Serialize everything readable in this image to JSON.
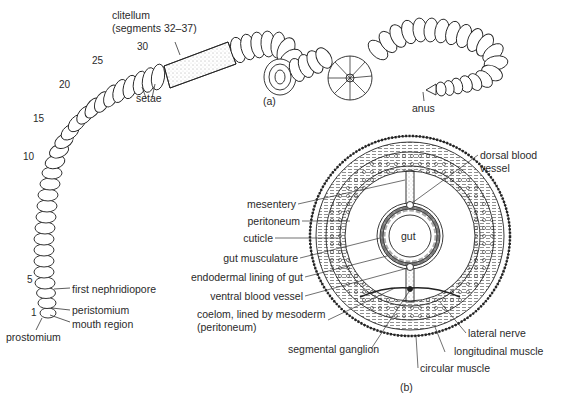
{
  "figure": {
    "panel_a": {
      "caption": "(a)",
      "labels": {
        "clitellum": "clitellum",
        "clitellum_segments": "(segments 32–37)",
        "setae": "setae",
        "anus": "anus",
        "first_nephridiopore": "first nephridiopore",
        "peristomium": "peristomium",
        "mouth_region": "mouth region",
        "prostomium": "prostomium"
      },
      "segment_numbers": [
        "1",
        "5",
        "10",
        "15",
        "20",
        "25",
        "30"
      ]
    },
    "panel_b": {
      "caption": "(b)",
      "labels": {
        "dorsal_blood_vessel_1": "dorsal blood",
        "dorsal_blood_vessel_2": "vessel",
        "mesentery": "mesentery",
        "peritoneum": "peritoneum",
        "cuticle": "cuticle",
        "gut": "gut",
        "gut_musculature": "gut musculature",
        "endodermal_lining": "endodermal lining of gut",
        "ventral_blood_vessel": "ventral blood vessel",
        "coelom_1": "coelom, lined by mesoderm",
        "coelom_2": "(peritoneum)",
        "segmental_ganglion": "segmental ganglion",
        "lateral_nerve": "lateral nerve",
        "longitudinal_muscle": "longitudinal muscle",
        "circular_muscle": "circular muscle"
      }
    }
  }
}
